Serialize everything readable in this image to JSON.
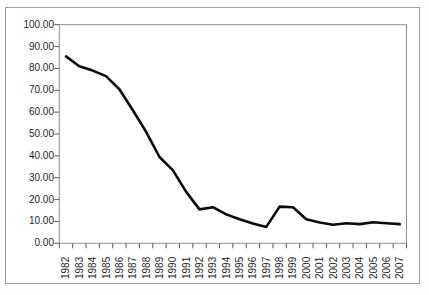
{
  "chart_data": {
    "type": "line",
    "title": "",
    "xlabel": "",
    "ylabel": "",
    "categories": [
      "1982",
      "1983",
      "1984",
      "1985",
      "1986",
      "1987",
      "1988",
      "1989",
      "1990",
      "1991",
      "1992",
      "1993",
      "1994",
      "1995",
      "1996",
      "1997",
      "1998",
      "1999",
      "2000",
      "2001",
      "2002",
      "2003",
      "2004",
      "2005",
      "2006",
      "2007"
    ],
    "values": [
      85.5,
      81.0,
      79.0,
      76.5,
      70.5,
      61.0,
      51.0,
      39.5,
      33.5,
      23.5,
      15.5,
      16.5,
      13.2,
      11.0,
      9.0,
      7.5,
      16.8,
      16.5,
      11.0,
      9.5,
      8.5,
      9.2,
      8.8,
      9.6,
      9.2,
      8.8
    ],
    "ylim": [
      0,
      100
    ],
    "y_tick_step": 10,
    "y_tick_labels": [
      "0.00",
      "10.00",
      "20.00",
      "30.00",
      "40.00",
      "50.00",
      "60.00",
      "70.00",
      "80.00",
      "90.00",
      "100.00"
    ],
    "grid": false,
    "legend": "none",
    "line_color": "#0b0b0b",
    "axis_color": "#8f8f8f",
    "tick_color": "#5a5a5a",
    "label_color": "#1f1f1f",
    "chart_border_color": "#9c9c9c",
    "plot_background": "#ffffff"
  }
}
